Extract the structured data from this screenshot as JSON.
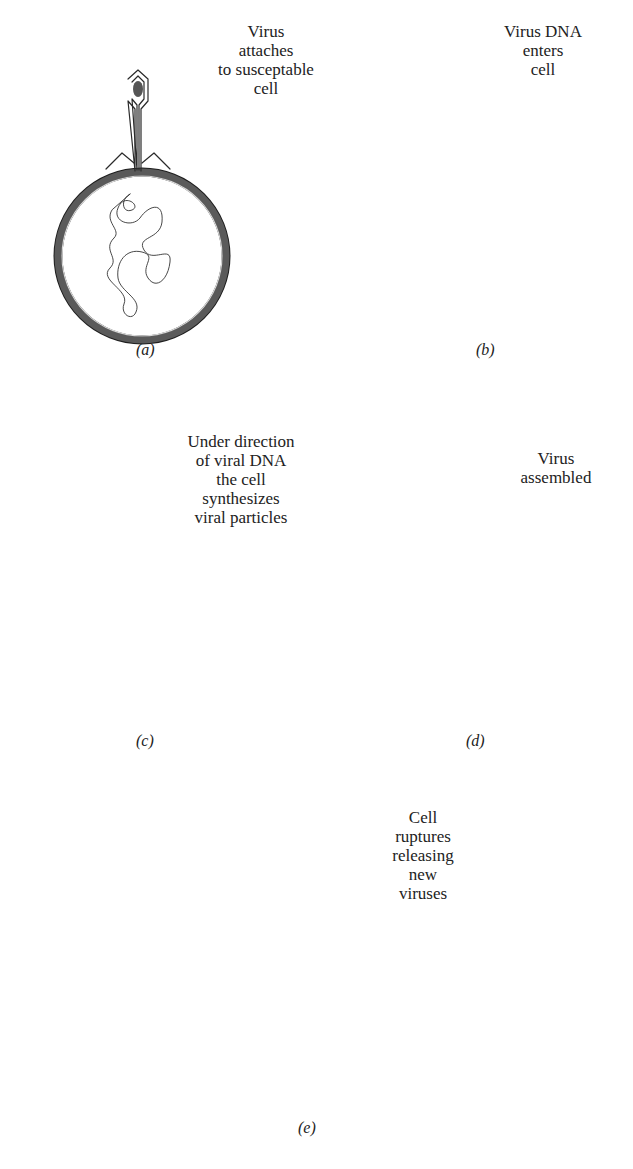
{
  "figure": {
    "ink_color": "#2a2a2a",
    "wall_color": "#5a5a5a",
    "background": "#ffffff"
  },
  "panels": [
    {
      "id": "a",
      "caption": "(a)",
      "label": "Virus\nattaches\nto susceptable\ncell"
    },
    {
      "id": "b",
      "caption": "(b)",
      "label": "Virus DNA\nenters\ncell"
    },
    {
      "id": "c",
      "caption": "(c)",
      "label": "Under direction\nof viral DNA\nthe cell\nsynthesizes\nviral particles"
    },
    {
      "id": "d",
      "caption": "(d)",
      "label": "Virus\nassembled"
    },
    {
      "id": "e",
      "caption": "(e)",
      "label": "Cell\nruptures\nreleasing\nnew\nviruses"
    }
  ],
  "icons": {
    "phage": "bacteriophage-icon",
    "cell": "bacterial-cell-icon",
    "dna": "dna-strand-icon"
  }
}
